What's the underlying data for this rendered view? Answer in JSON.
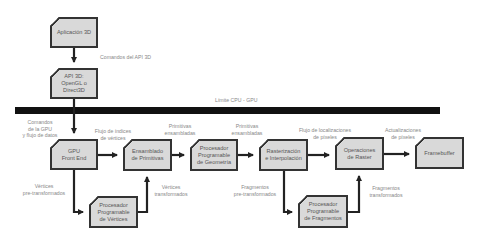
{
  "nodes": {
    "app": "Aplicación 3D",
    "api": "API 3D:\nOpenGL o\nDirect3D",
    "gpu_front_end": "GPU\nFront End",
    "ensamblado": "Ensamblado\nde Primitivas",
    "geometria": "Procesador\nProgramable\nde Geometría",
    "rasterizacion": "Rasterización\ne Interpolación",
    "raster_ops": "Operaciones\nde Raster",
    "framebuffer": "Framebuffer",
    "vertices_proc": "Procesador\nProgramable\nde Vértices",
    "fragmentos_proc": "Procesador\nProgramable\nde Fragmentos"
  },
  "edge_labels": {
    "api_commands": "Comandos del API 3D",
    "cpu_gpu_line": "Límite CPU - GPU",
    "gpu_commands": "Comandos\nde la GPU\ny flujo de datos",
    "vertex_index_flow": "Flujo de índices\nde vértices",
    "assembled_primitives_1": "Primitivas\nensambladas",
    "assembled_primitives_2": "Primitivas\nensambladas",
    "pixel_location_flow": "Flujo de localizaciones\nde píxeles",
    "pixel_updates": "Actualizaciones\nde píxeles",
    "pretransformed_vertices": "Vértices\npre-transformados",
    "transformed_vertices": "Vértices\ntransformados",
    "pretransformed_fragments": "Fragmentos\npre-transformados",
    "transformed_fragments": "Fragmentos\ntransformados"
  },
  "colors": {
    "box_fill": "#d9d9d9",
    "stroke": "#222222",
    "label": "#888888"
  }
}
